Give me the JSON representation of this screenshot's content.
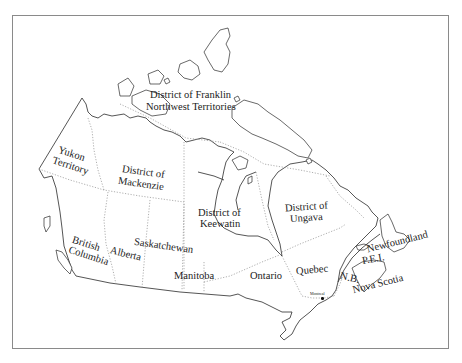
{
  "map": {
    "title": "",
    "regions": [
      {
        "id": "district-of-franklin",
        "label": "District of Franklin"
      },
      {
        "id": "northwest-territories",
        "label": "Northwest Territories"
      },
      {
        "id": "yukon-territory",
        "label_line1": "Yukon",
        "label_line2": "Territory"
      },
      {
        "id": "district-of-mackenzie",
        "label_line1": "District of",
        "label_line2": "Mackenzie"
      },
      {
        "id": "district-of-keewatin",
        "label_line1": "District of",
        "label_line2": "Keewatin"
      },
      {
        "id": "district-of-ungava",
        "label_line1": "District of",
        "label_line2": "Ungava"
      },
      {
        "id": "british-columbia",
        "label_line1": "British",
        "label_line2": "Columbia"
      },
      {
        "id": "alberta",
        "label": "Alberta"
      },
      {
        "id": "saskatchewan",
        "label": "Saskatchewan"
      },
      {
        "id": "manitoba",
        "label": "Manitoba"
      },
      {
        "id": "ontario",
        "label": "Ontario"
      },
      {
        "id": "quebec",
        "label": "Quebec"
      },
      {
        "id": "new-brunswick",
        "label": "N.B."
      },
      {
        "id": "prince-edward-island",
        "label": "P.E.I."
      },
      {
        "id": "nova-scotia",
        "label": "Nova Scotia"
      },
      {
        "id": "newfoundland",
        "label": "Newfoundland"
      }
    ],
    "cities": [
      {
        "id": "montreal",
        "label": "Montreal"
      }
    ],
    "colors": {
      "coastline": "#2a2a2a",
      "border_dotted": "#8c8c8c",
      "frame": "#8a8a8a",
      "background": "#ffffff"
    }
  }
}
